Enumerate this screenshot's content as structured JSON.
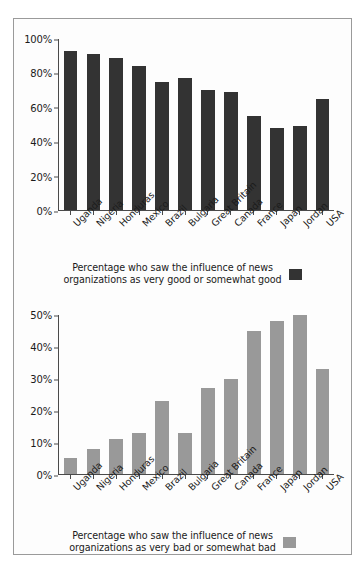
{
  "figure": {
    "border_color": "#9a9a9a",
    "background": "#fdfdfd"
  },
  "colors": {
    "good_series": "#333333",
    "bad_series": "#999999",
    "axis": "#4a4a4a",
    "text": "#1b1b1b"
  },
  "legends": {
    "top_line1": "Percentage who saw the influence of news",
    "top_line2": "organizations as very good or somewhat good",
    "bottom_line1": "Percentage who saw the influence of news",
    "bottom_line2": "organizations as very bad or somewhat bad"
  },
  "chart_data": [
    {
      "type": "bar",
      "title": "Percentage who saw the influence of news organizations as very good or somewhat good",
      "xlabel": "",
      "ylabel": "",
      "ylim": [
        0,
        100
      ],
      "grid": false,
      "legend_position": "bottom",
      "bar_color": "#333333",
      "yticks": [
        "0%",
        "20%",
        "40%",
        "60%",
        "80%",
        "100%"
      ],
      "ytick_values": [
        0,
        20,
        40,
        60,
        80,
        100
      ],
      "categories": [
        "Uganda",
        "Nigeria",
        "Honduras",
        "Mexico",
        "Brazil",
        "Bulgaria",
        "Great Britain",
        "Canada",
        "France",
        "Japan",
        "Jordan",
        "USA"
      ],
      "values": [
        93,
        91,
        89,
        84,
        75,
        77,
        70,
        69,
        55,
        48,
        49,
        65
      ],
      "series": [
        {
          "name": "Percentage who saw the influence of news organizations as very good or somewhat good",
          "values": [
            93,
            91,
            89,
            84,
            75,
            77,
            70,
            69,
            55,
            48,
            49,
            65
          ]
        }
      ]
    },
    {
      "type": "bar",
      "title": "Percentage who saw the influence of news organizations as very bad or somewhat bad",
      "xlabel": "",
      "ylabel": "",
      "ylim": [
        0,
        50
      ],
      "grid": false,
      "legend_position": "bottom",
      "bar_color": "#999999",
      "yticks": [
        "0%",
        "10%",
        "20%",
        "30%",
        "40%",
        "50%"
      ],
      "ytick_values": [
        0,
        10,
        20,
        30,
        40,
        50
      ],
      "categories": [
        "Uganda",
        "Nigeria",
        "Honduras",
        "Mexico",
        "Brazil",
        "Bulgaria",
        "Great Britain",
        "Canada",
        "France",
        "Japan",
        "Jordan",
        "USA"
      ],
      "values": [
        5,
        8,
        11,
        13,
        23,
        13,
        27,
        30,
        45,
        48,
        50,
        33
      ],
      "series": [
        {
          "name": "Percentage who saw the influence of news organizations as very bad or somewhat bad",
          "values": [
            5,
            8,
            11,
            13,
            23,
            13,
            27,
            30,
            45,
            48,
            50,
            33
          ]
        }
      ]
    }
  ]
}
